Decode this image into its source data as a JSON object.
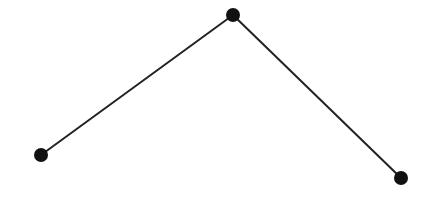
{
  "diagram": {
    "width": 444,
    "height": 224,
    "background": "#ffffff",
    "node_color": "#111111",
    "edge_color": "#222222",
    "edge_width": 2,
    "node_radius": 7,
    "nodes": [
      {
        "id": "n1",
        "x": 41,
        "y": 155
      },
      {
        "id": "n2",
        "x": 233,
        "y": 15
      },
      {
        "id": "n3",
        "x": 401,
        "y": 178
      }
    ],
    "edges": [
      {
        "from": "n1",
        "to": "n2"
      },
      {
        "from": "n2",
        "to": "n3"
      }
    ]
  }
}
